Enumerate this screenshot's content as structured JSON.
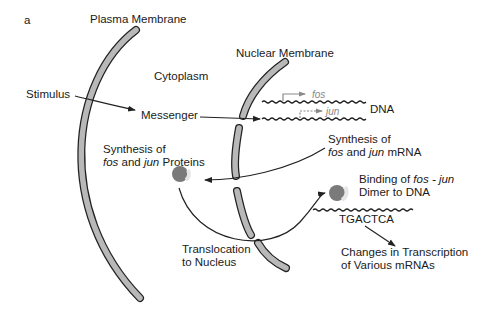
{
  "figure": {
    "panel_label": "a",
    "labels": {
      "plasma_membrane": "Plasma Membrane",
      "nuclear_membrane": "Nuclear Membrane",
      "cytoplasm": "Cytoplasm",
      "stimulus": "Stimulus",
      "messenger": "Messenger",
      "dna": "DNA",
      "fos_gene": "fos",
      "jun_gene": "jun",
      "synthesis_mrna_line1": "Synthesis of",
      "synthesis_mrna_fos": "fos",
      "synthesis_mrna_and": " and ",
      "synthesis_mrna_jun": "jun",
      "synthesis_mrna_tail": " mRNA",
      "synthesis_protein_line1": "Synthesis of",
      "synthesis_protein_fos": "fos",
      "synthesis_protein_and": " and ",
      "synthesis_protein_jun": "jun",
      "synthesis_protein_tail": " Proteins",
      "binding_line1_prefix": "Binding of ",
      "binding_line1_italic": "fos - jun",
      "binding_line2": "Dimer to DNA",
      "sequence": "TGACTCA",
      "translocation_line1": "Translocation",
      "translocation_line2": "to Nucleus",
      "changes_line1": "Changes in Transcription",
      "changes_line2": "of Various mRNAs"
    },
    "colors": {
      "membrane_fill": "#b8b8b8",
      "outline": "#222222",
      "protein": "#7a7a7a",
      "gene_arrow": "#8a8a8a"
    }
  }
}
